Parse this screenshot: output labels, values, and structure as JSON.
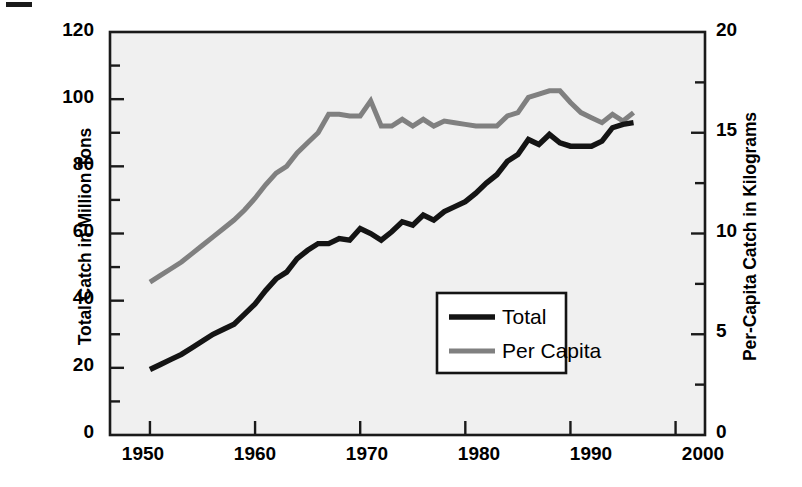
{
  "chart_data": {
    "type": "line",
    "title": "",
    "subtitle": "",
    "xlabel": "",
    "ylabel": "Total Catch in Million Tons",
    "ylabel_right": "Per-Capita Catch in Kilograms",
    "xlim": [
      1946.2,
      2002.8
    ],
    "ylim": [
      0,
      120
    ],
    "ylim_right": [
      0,
      20
    ],
    "grid": false,
    "legend_position": "lower right",
    "xticks": [
      1950,
      1960,
      1970,
      1980,
      1990,
      2000
    ],
    "xtick_labels": [
      "1950",
      "1960",
      "1970",
      "1980",
      "1990",
      "2000"
    ],
    "yticks_left": [
      0,
      20,
      40,
      60,
      80,
      100,
      120
    ],
    "ytick_labels_left": [
      "0",
      "20",
      "40",
      "60",
      "80",
      "100",
      "120"
    ],
    "yticks_left_minor": [
      10,
      30,
      50,
      70,
      90,
      110
    ],
    "yticks_right": [
      0,
      5,
      10,
      15,
      20
    ],
    "ytick_labels_right": [
      "0",
      "5",
      "10",
      "15",
      "20"
    ],
    "yticks_right_minor": [
      2.5,
      7.5,
      12.5,
      17.5
    ],
    "x": [
      1950,
      1951,
      1952,
      1953,
      1954,
      1955,
      1956,
      1957,
      1958,
      1959,
      1960,
      1961,
      1962,
      1963,
      1964,
      1965,
      1966,
      1967,
      1968,
      1969,
      1970,
      1971,
      1972,
      1973,
      1974,
      1975,
      1976,
      1977,
      1978,
      1979,
      1980,
      1981,
      1982,
      1983,
      1984,
      1985,
      1986,
      1987,
      1988,
      1989,
      1990,
      1991,
      1992,
      1993,
      1994,
      1995,
      1996
    ],
    "series": [
      {
        "name": "Total",
        "axis": "left",
        "units": "million tons",
        "color": "#141414",
        "values": [
          19.5,
          21.0,
          22.5,
          24.0,
          26.0,
          28.0,
          30.0,
          31.5,
          33.0,
          36.0,
          39.0,
          43.0,
          46.5,
          48.5,
          52.5,
          55.0,
          57.0,
          57.0,
          58.5,
          58.0,
          61.5,
          60.0,
          58.0,
          60.5,
          63.5,
          62.5,
          65.5,
          64.0,
          66.5,
          68.0,
          69.5,
          72.0,
          75.0,
          77.5,
          81.5,
          83.5,
          88.0,
          86.5,
          89.5,
          87.0,
          86.0,
          86.0,
          86.0,
          87.5,
          91.5,
          92.5,
          93.0
        ]
      },
      {
        "name": "Per Capita",
        "axis": "right",
        "units": "kilograms",
        "values_left_scale": [
          45.5,
          47.5,
          49.5,
          51.5,
          54.0,
          56.5,
          59.0,
          61.5,
          64.0,
          67.0,
          70.5,
          74.5,
          78.0,
          80.0,
          84.0,
          87.0,
          90.0,
          95.5,
          95.5,
          95.0,
          95.0,
          99.5,
          92.0,
          92.0,
          94.0,
          92.0,
          94.0,
          92.0,
          93.5,
          93.0,
          92.5,
          92.0,
          92.0,
          92.0,
          95.0,
          96.0,
          100.5,
          101.5,
          102.5,
          102.5,
          99.0,
          96.0,
          94.5,
          93.0,
          95.5,
          93.5,
          96.0
        ],
        "color": "#808080",
        "values": [
          7.6,
          7.9,
          8.3,
          8.6,
          9.0,
          9.4,
          9.8,
          10.3,
          10.7,
          11.2,
          11.8,
          12.4,
          13.0,
          13.3,
          14.0,
          14.5,
          15.0,
          15.9,
          15.9,
          15.8,
          15.8,
          16.6,
          15.3,
          15.3,
          15.7,
          15.3,
          15.7,
          15.3,
          15.6,
          15.5,
          15.4,
          15.3,
          15.3,
          15.3,
          15.8,
          16.0,
          16.8,
          16.9,
          17.1,
          17.1,
          16.5,
          16.0,
          15.8,
          15.5,
          15.9,
          15.6,
          16.0
        ]
      }
    ],
    "legend_entries": [
      {
        "label": "Total",
        "color": "#141414"
      },
      {
        "label": "Per Capita",
        "color": "#808080"
      }
    ]
  },
  "colors": {
    "plot_background": "#f0f0f0",
    "axis": "#1a1a1a",
    "total_line": "#141414",
    "percapita_line": "#808080",
    "legend_background": "#ffffff",
    "legend_border": "#141414",
    "page_background": "#ffffff"
  }
}
